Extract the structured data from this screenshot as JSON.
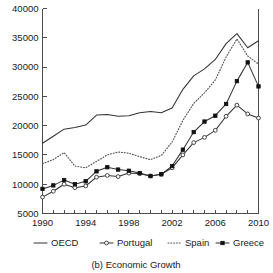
{
  "caption": "(b) Economic Growth",
  "chart_data": {
    "type": "line",
    "title": "",
    "subtitle": "",
    "xlabel": "",
    "ylabel": "",
    "xlim": [
      1990,
      2010
    ],
    "ylim": [
      5000,
      40000
    ],
    "grid": false,
    "legend_position": "bottom",
    "x": [
      1990,
      1991,
      1992,
      1993,
      1994,
      1995,
      1996,
      1997,
      1998,
      1999,
      2000,
      2001,
      2002,
      2003,
      2004,
      2005,
      2006,
      2007,
      2008,
      2009,
      2010
    ],
    "xticks": [
      1990,
      1991,
      1992,
      1993,
      1994,
      1995,
      1996,
      1997,
      1998,
      1999,
      2000,
      2001,
      2002,
      2003,
      2004,
      2005,
      2006,
      2007,
      2008,
      2009,
      2010
    ],
    "xticklabels": [
      "1990",
      "",
      "",
      "",
      "1994",
      "",
      "",
      "",
      "1998",
      "",
      "",
      "",
      "2002",
      "",
      "",
      "",
      "2006",
      "",
      "",
      "",
      "2010"
    ],
    "yticks": [
      5000,
      10000,
      15000,
      20000,
      25000,
      30000,
      35000,
      40000
    ],
    "yticklabels": [
      "5000",
      "10000",
      "15000",
      "20000",
      "25000",
      "30000",
      "35000",
      "40000"
    ],
    "series": [
      {
        "name": "OECD",
        "style": "solid",
        "marker": "none",
        "color": "#333333",
        "values": [
          17000,
          18200,
          19400,
          19700,
          20100,
          21800,
          21900,
          21600,
          21700,
          22200,
          22400,
          22200,
          23000,
          26200,
          28500,
          29700,
          31300,
          34000,
          35700,
          33300,
          34500
        ]
      },
      {
        "name": "Portugal",
        "style": "solid",
        "marker": "open-circle",
        "color": "#333333",
        "values": [
          7800,
          8800,
          10000,
          9400,
          9700,
          11200,
          11500,
          11300,
          11900,
          11800,
          11400,
          11700,
          12800,
          15000,
          17100,
          18000,
          19200,
          21600,
          23500,
          22000,
          21300
        ]
      },
      {
        "name": "Spain",
        "style": "dotted",
        "marker": "none",
        "color": "#555555",
        "values": [
          13500,
          14200,
          15400,
          13100,
          12800,
          13900,
          15000,
          15500,
          15300,
          14700,
          14200,
          14900,
          17200,
          20900,
          23800,
          25600,
          27800,
          31700,
          34800,
          31900,
          30500
        ]
      },
      {
        "name": "Greece",
        "style": "solid",
        "marker": "filled-square",
        "color": "#111111",
        "values": [
          9200,
          9800,
          10700,
          10000,
          10500,
          12200,
          12900,
          12500,
          12300,
          11900,
          11400,
          11700,
          13100,
          15900,
          18900,
          20700,
          21700,
          23700,
          27600,
          30800,
          26700
        ]
      }
    ]
  },
  "legend": [
    {
      "label": "OECD",
      "swatch": "solid-line"
    },
    {
      "label": "Portugal",
      "swatch": "line-open-circle"
    },
    {
      "label": "Spain",
      "swatch": "dotted-line"
    },
    {
      "label": "Greece",
      "swatch": "line-filled-square"
    }
  ]
}
